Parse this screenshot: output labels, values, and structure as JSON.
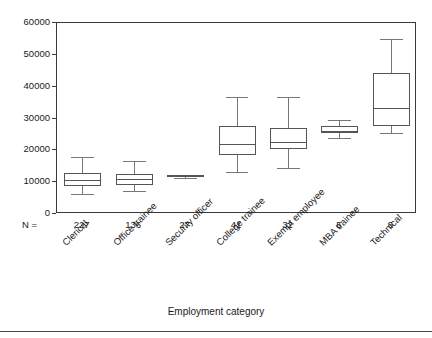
{
  "chart_data": {
    "type": "box",
    "title": "",
    "xlabel": "Employment category",
    "ylabel": "",
    "ylim": [
      0,
      60000
    ],
    "ytick_labels": [
      "0",
      "10000",
      "20000",
      "30000",
      "40000",
      "50000",
      "60000"
    ],
    "ytick_values": [
      0,
      10000,
      20000,
      30000,
      40000,
      50000,
      60000
    ],
    "grid": false,
    "legend": null,
    "n_label": "N =",
    "categories": [
      "Clerical",
      "Office trainee",
      "Security officer",
      "College trainee",
      "Exempt employee",
      "MBA trainee",
      "Technical"
    ],
    "counts": [
      "227",
      "136",
      "27",
      "41",
      "32",
      "5",
      "6"
    ],
    "boxes": [
      {
        "category": "Clerical",
        "whisker_low": 6300,
        "q1": 8900,
        "median": 10800,
        "q3": 13000,
        "whisker_high": 17800
      },
      {
        "category": "Office trainee",
        "whisker_low": 7300,
        "q1": 9200,
        "median": 11000,
        "q3": 12700,
        "whisker_high": 16800
      },
      {
        "category": "Security officer",
        "whisker_low": 11400,
        "q1": 11700,
        "median": 11900,
        "q3": 12100,
        "whisker_high": 12300
      },
      {
        "category": "College trainee",
        "whisker_low": 13300,
        "q1": 18400,
        "median": 21900,
        "q3": 27600,
        "whisker_high": 36800
      },
      {
        "category": "Exempt employee",
        "whisker_low": 14600,
        "q1": 20300,
        "median": 22500,
        "q3": 27000,
        "whisker_high": 36800
      },
      {
        "category": "MBA trainee",
        "whisker_low": 23800,
        "q1": 25400,
        "median": 26000,
        "q3": 27600,
        "whisker_high": 29500
      },
      {
        "category": "Technical",
        "whisker_low": 25400,
        "q1": 27600,
        "median": 33300,
        "q3": 44400,
        "whisker_high": 54900
      }
    ],
    "colors": {
      "axis": "#3a3a3a",
      "box_stroke": "#555555",
      "whisker": "#777777",
      "background": "#ffffff",
      "text": "#1a1a1a"
    }
  }
}
